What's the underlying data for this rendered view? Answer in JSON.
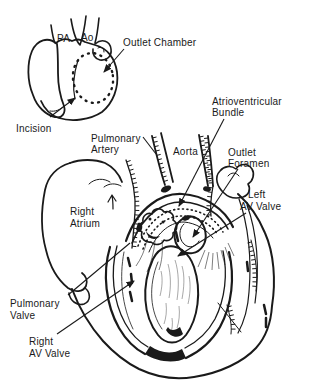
{
  "colors": {
    "background": "#ffffff",
    "ink": "#1a1a1a"
  },
  "inset": {
    "pa_label": "PA",
    "ao_label": "Ao",
    "outlet_chamber_label": "Outlet Chamber",
    "incision_label": "Incision"
  },
  "main": {
    "pulmonary_artery_line1": "Pulmonary",
    "pulmonary_artery_line2": "Artery",
    "aorta_label": "Aorta",
    "av_bundle_line1": "Atrioventricular",
    "av_bundle_line2": "Bundle",
    "outlet_foramen_line1": "Outlet",
    "outlet_foramen_line2": "Foramen",
    "left_av_valve_line1": "Left",
    "left_av_valve_line2": "AV Valve",
    "right_atrium_line1": "Right",
    "right_atrium_line2": "Atrium",
    "pulmonary_valve_line1": "Pulmonary",
    "pulmonary_valve_line2": "Valve",
    "right_av_valve_line1": "Right",
    "right_av_valve_line2": "AV Valve"
  }
}
